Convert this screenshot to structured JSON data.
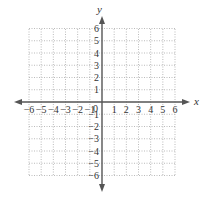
{
  "diagram": {
    "type": "coordinate-plane",
    "x_axis_label": "x",
    "y_axis_label": "y",
    "origin_label": "0",
    "x_range": [
      -6,
      6
    ],
    "y_range": [
      -6,
      6
    ],
    "grid": "dotted",
    "x_ticks": [
      "−6",
      "−5",
      "−4",
      "−3",
      "−2",
      "−1",
      "1",
      "2",
      "3",
      "4",
      "5",
      "6"
    ],
    "y_ticks": [
      "6",
      "5",
      "4",
      "3",
      "2",
      "1",
      "−1",
      "−2",
      "−3",
      "−4",
      "−5",
      "−6"
    ],
    "colors": {
      "axis": "#555555",
      "grid": "#aaaaaa",
      "text": "#333333"
    }
  }
}
